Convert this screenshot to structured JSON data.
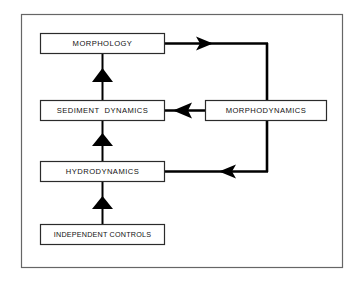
{
  "diagram": {
    "frame": {
      "name": "outer-frame",
      "x": 21,
      "y": 14,
      "width": 322,
      "height": 254,
      "stroke": "#555555",
      "stroke_width": 1.2,
      "fill": "#ffffff"
    },
    "colors": {
      "background": "#ffffff",
      "box_stroke": "#2b2b2b",
      "box_fill": "#ffffff",
      "connector": "#000000",
      "text": "#111111",
      "frame": "#555555"
    },
    "nodes": [
      {
        "id": "morphology",
        "label": "MORPHOLOGY",
        "x": 40,
        "y": 33,
        "width": 125,
        "height": 21
      },
      {
        "id": "sediment_dynamics",
        "label": "SEDIMENT  DYNAMICS",
        "x": 40,
        "y": 100,
        "width": 125,
        "height": 21
      },
      {
        "id": "hydrodynamics",
        "label": "HYDRODYNAMICS",
        "x": 40,
        "y": 161,
        "width": 125,
        "height": 21
      },
      {
        "id": "independent_controls",
        "label": "INDEPENDENT CONTROLS",
        "x": 40,
        "y": 224,
        "width": 125,
        "height": 21
      },
      {
        "id": "morphodynamics",
        "label": "MORPHODYNAMICS",
        "x": 205,
        "y": 100,
        "width": 122,
        "height": 21
      }
    ],
    "connectors": [
      {
        "id": "independent-to-hydrodynamics",
        "from": "independent_controls",
        "to": "hydrodynamics",
        "direction": "up",
        "arrowhead": "up"
      },
      {
        "id": "hydrodynamics-to-sediment",
        "from": "hydrodynamics",
        "to": "sediment_dynamics",
        "direction": "up",
        "arrowhead": "up"
      },
      {
        "id": "sediment-to-morphology",
        "from": "sediment_dynamics",
        "to": "morphology",
        "direction": "up",
        "arrowhead": "up"
      },
      {
        "id": "morphology-to-morphodynamics",
        "from": "morphology",
        "to": "morphodynamics",
        "direction": "right-then-down",
        "arrowhead": "right"
      },
      {
        "id": "morphodynamics-to-sediment",
        "from": "morphodynamics",
        "to": "sediment_dynamics",
        "direction": "left",
        "arrowhead": "left"
      },
      {
        "id": "morphodynamics-to-hydrodynamics",
        "from": "morphodynamics",
        "to": "hydrodynamics",
        "direction": "down-then-left",
        "arrowhead": "left"
      }
    ]
  }
}
